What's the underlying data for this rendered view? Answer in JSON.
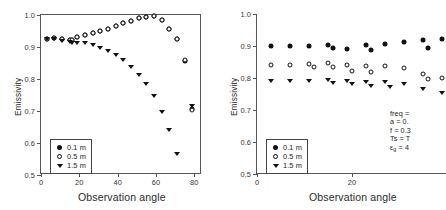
{
  "figure": {
    "panel_count": 2,
    "note": "Two-panel emissivity plot; right panel clipped at image right edge"
  },
  "axes": {
    "ylabel": "Emissivity",
    "xlabel": "Observation angle",
    "yticks": [
      "0.5",
      "0.6",
      "0.7",
      "0.8",
      "0.9",
      "1.0"
    ],
    "ytick_values": [
      0.5,
      0.6,
      0.7,
      0.8,
      0.9,
      1.0
    ],
    "xticks_left": [
      "0",
      "20",
      "40",
      "60",
      "80"
    ],
    "xticks_right": [
      "0",
      "20"
    ],
    "ylim": [
      0.5,
      1.0
    ],
    "xlim": [
      0,
      84
    ]
  },
  "legend": {
    "items": [
      {
        "label": "0.1 m",
        "marker": "filled-circle"
      },
      {
        "label": "0.5 m",
        "marker": "open-circle"
      },
      {
        "label": "1.5 m",
        "marker": "filled-triangle"
      }
    ]
  },
  "annotation": {
    "lines": [
      "freq =",
      "a = 0.",
      "f = 0.3",
      "Ts = T",
      "εg = 4"
    ],
    "clipped": true
  },
  "chart_data": [
    {
      "type": "scatter",
      "panel": "left",
      "title": "",
      "xlabel": "Observation angle",
      "ylabel": "Emissivity",
      "xlim": [
        0,
        84
      ],
      "ylim": [
        0.5,
        1.0
      ],
      "grid": false,
      "legend_position": "lower-left",
      "series": [
        {
          "name": "0.1 m",
          "marker": "filled-circle",
          "x": [
            3,
            7,
            11,
            15,
            16,
            19,
            23,
            27,
            31,
            35,
            39,
            43,
            47,
            51,
            55,
            59,
            63,
            67,
            71,
            75,
            79
          ],
          "y": [
            0.926,
            0.927,
            0.925,
            0.923,
            0.921,
            0.93,
            0.938,
            0.944,
            0.95,
            0.957,
            0.966,
            0.974,
            0.982,
            0.99,
            0.995,
            0.998,
            0.985,
            0.955,
            0.925,
            0.855,
            0.705
          ]
        },
        {
          "name": "0.5 m",
          "marker": "open-circle",
          "x": [
            3,
            7,
            11,
            15,
            16,
            19,
            23,
            27,
            31,
            35,
            39,
            43,
            47,
            51,
            55,
            59,
            63,
            67,
            71,
            75,
            79
          ],
          "y": [
            0.926,
            0.927,
            0.925,
            0.923,
            0.921,
            0.93,
            0.938,
            0.944,
            0.95,
            0.957,
            0.966,
            0.974,
            0.982,
            0.99,
            0.995,
            0.998,
            0.985,
            0.955,
            0.925,
            0.858,
            0.702
          ]
        },
        {
          "name": "1.5 m",
          "marker": "filled-triangle",
          "x": [
            3,
            7,
            11,
            15,
            16,
            19,
            23,
            27,
            31,
            35,
            39,
            43,
            47,
            51,
            55,
            59,
            63,
            67,
            71,
            79
          ],
          "y": [
            0.925,
            0.924,
            0.92,
            0.917,
            0.914,
            0.913,
            0.911,
            0.905,
            0.897,
            0.887,
            0.874,
            0.858,
            0.838,
            0.813,
            0.783,
            0.747,
            0.698,
            0.641,
            0.566,
            0.715
          ]
        }
      ]
    },
    {
      "type": "scatter",
      "panel": "right",
      "title": "",
      "xlabel": "Observation angle",
      "ylabel": "Emissivity",
      "xlim": [
        0,
        40
      ],
      "ylim": [
        0.5,
        1.0
      ],
      "grid": false,
      "legend_position": "lower-left",
      "series": [
        {
          "name": "0.1 m",
          "marker": "filled-circle",
          "x": [
            3,
            7,
            11,
            15,
            16,
            19,
            23,
            24,
            27,
            31,
            35,
            36,
            39
          ],
          "y": [
            0.901,
            0.901,
            0.899,
            0.902,
            0.895,
            0.89,
            0.903,
            0.889,
            0.905,
            0.911,
            0.919,
            0.893,
            0.922
          ]
        },
        {
          "name": "0.5 m",
          "marker": "open-circle",
          "x": [
            3,
            7,
            11,
            12,
            15,
            16,
            19,
            20,
            23,
            24,
            27,
            31,
            35,
            36,
            39
          ],
          "y": [
            0.841,
            0.841,
            0.843,
            0.834,
            0.846,
            0.834,
            0.841,
            0.823,
            0.839,
            0.818,
            0.836,
            0.831,
            0.812,
            0.797,
            0.801
          ]
        },
        {
          "name": "1.5 m",
          "marker": "filled-triangle",
          "x": [
            3,
            7,
            11,
            15,
            16,
            19,
            20,
            23,
            24,
            27,
            28,
            31,
            35,
            39
          ],
          "y": [
            0.791,
            0.79,
            0.79,
            0.794,
            0.784,
            0.79,
            0.78,
            0.788,
            0.776,
            0.787,
            0.772,
            0.781,
            0.766,
            0.754
          ]
        }
      ]
    }
  ]
}
